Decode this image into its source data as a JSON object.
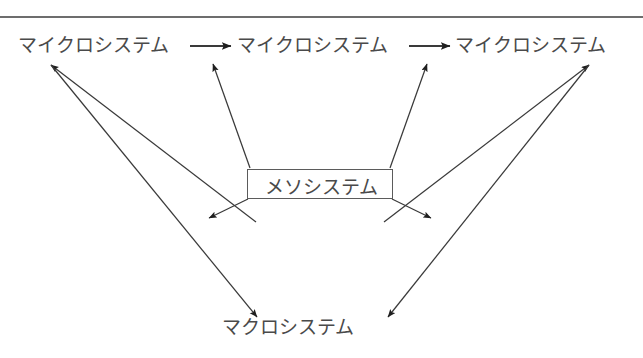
{
  "page": {
    "background_color": "#ffffff",
    "line_color": "#3a3a3a",
    "text_color": "#4a4a4a",
    "rule_color": "#6d6d6d"
  },
  "diagram": {
    "type": "node-arrow-diagram",
    "nodes": {
      "micro_1": "マイクロシステム",
      "micro_2": "マイクロシステム",
      "micro_3": "マイクロシステム",
      "meso": "メソシステム",
      "macro": "マクロシステム"
    },
    "connections": [
      {
        "from": "micro_1",
        "to": "micro_2",
        "style": "arrow-right"
      },
      {
        "from": "micro_2",
        "to": "micro_3",
        "style": "arrow-right"
      },
      {
        "from": "meso",
        "to": "micro_1",
        "style": "arrow-diagonal-up-left"
      },
      {
        "from": "meso",
        "to": "micro_2",
        "style": "arrow-diagonal-up-left-short"
      },
      {
        "from": "meso",
        "to": "micro_2b",
        "style": "arrow-diagonal-up-right-short"
      },
      {
        "from": "meso",
        "to": "micro_3",
        "style": "arrow-diagonal-up-right"
      },
      {
        "from": "meso",
        "to": "macro_left",
        "style": "arrow-diagonal-down-left-short"
      },
      {
        "from": "meso",
        "to": "macro_right",
        "style": "arrow-diagonal-down-right-short"
      },
      {
        "from": "micro_1",
        "to": "macro",
        "style": "arrow-long-diagonal-down-right"
      },
      {
        "from": "micro_3",
        "to": "macro",
        "style": "arrow-long-diagonal-down-left"
      }
    ]
  }
}
